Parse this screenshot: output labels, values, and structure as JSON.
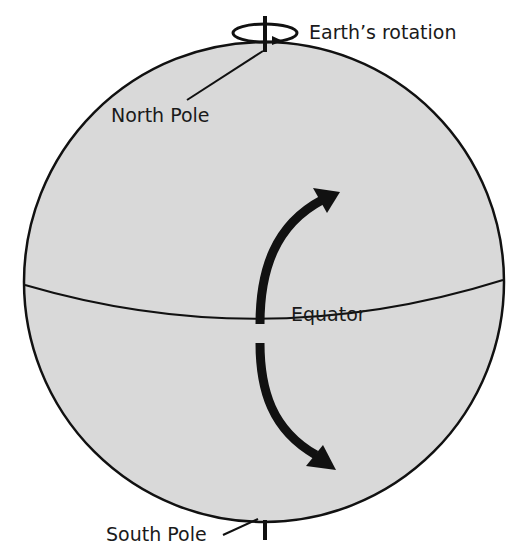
{
  "diagram": {
    "labels": {
      "rotation": "Earth’s rotation",
      "north_pole": "North Pole",
      "equator": "Equator",
      "south_pole": "South Pole"
    },
    "colors": {
      "sphere_fill": "#d9d9d9",
      "stroke": "#111111",
      "background": "#ffffff"
    }
  }
}
